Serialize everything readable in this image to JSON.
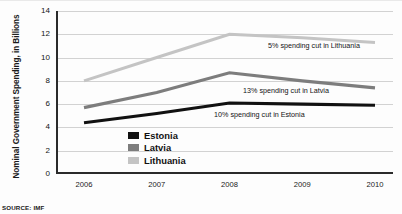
{
  "source_note": "SOURCE: IMF",
  "axes": {
    "ylabel": "Nominal Government Spending, in Billions",
    "xlabel": "",
    "yticks": [
      "0",
      "2",
      "4",
      "6",
      "8",
      "10",
      "12",
      "14"
    ],
    "xticks": [
      "2006",
      "2007",
      "2008",
      "2009",
      "2010"
    ]
  },
  "legend": {
    "items": [
      {
        "label": "Estonia",
        "color": "#111111"
      },
      {
        "label": "Latvia",
        "color": "#7d7d7d"
      },
      {
        "label": "Lithuania",
        "color": "#c4c4c4"
      }
    ]
  },
  "annotations": [
    {
      "text": "5% spending cut in Lithuania"
    },
    {
      "text": "13% spending cut in Latvia"
    },
    {
      "text": "10% spending cut in Estonia"
    }
  ],
  "chart_data": {
    "type": "line",
    "title": "",
    "xlabel": "",
    "ylabel": "Nominal Government Spending, in Billions",
    "categories": [
      "2006",
      "2007",
      "2008",
      "2009",
      "2010"
    ],
    "ylim": [
      0,
      14
    ],
    "ytick_step": 2,
    "grid": true,
    "legend_position": "inside-bottom-center",
    "series": [
      {
        "name": "Estonia",
        "color": "#111111",
        "values": [
          4.4,
          5.2,
          6.1,
          6.0,
          5.9
        ]
      },
      {
        "name": "Latvia",
        "color": "#7d7d7d",
        "values": [
          5.7,
          7.0,
          8.7,
          8.0,
          7.4
        ]
      },
      {
        "name": "Lithuania",
        "color": "#c4c4c4",
        "values": [
          8.0,
          10.0,
          12.0,
          11.7,
          11.3
        ]
      }
    ],
    "annotations": [
      {
        "text": "5% spending cut in Lithuania",
        "series": "Lithuania",
        "x": "2009"
      },
      {
        "text": "13% spending cut in Latvia",
        "series": "Latvia",
        "x": "2009"
      },
      {
        "text": "10% spending cut in Estonia",
        "series": "Estonia",
        "x": "2009"
      }
    ]
  }
}
